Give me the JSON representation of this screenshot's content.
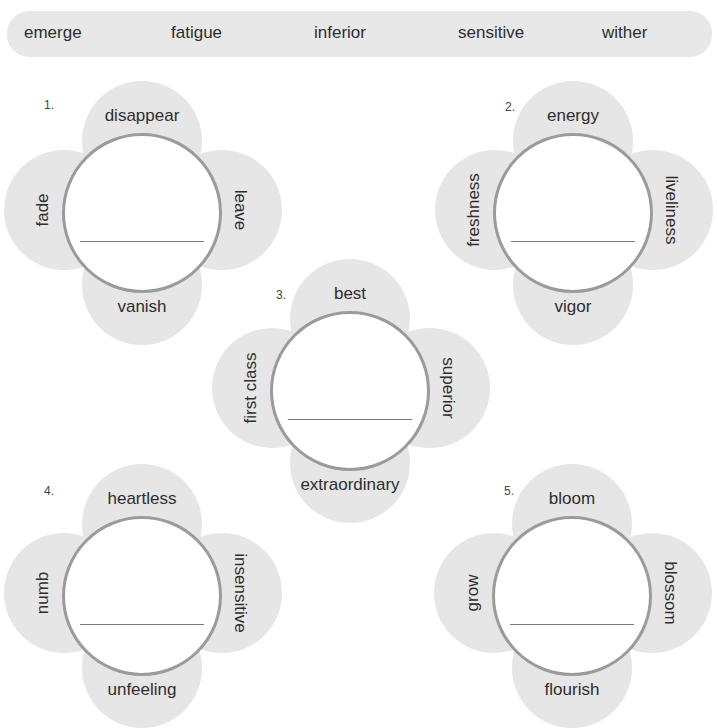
{
  "word_bank": {
    "words": [
      "emerge",
      "fatigue",
      "inferior",
      "sensitive",
      "wither"
    ]
  },
  "flowers": [
    {
      "number": "1.",
      "top": "disappear",
      "left": "fade",
      "right": "leave",
      "bottom": "vanish",
      "answer": ""
    },
    {
      "number": "2.",
      "top": "energy",
      "left": "freshness",
      "right": "liveliness",
      "bottom": "vigor",
      "answer": ""
    },
    {
      "number": "3.",
      "top": "best",
      "left": "first class",
      "right": "superior",
      "bottom": "extraordinary",
      "answer": ""
    },
    {
      "number": "4.",
      "top": "heartless",
      "left": "numb",
      "right": "insensitive",
      "bottom": "unfeeling",
      "answer": ""
    },
    {
      "number": "5.",
      "top": "bloom",
      "left": "grow",
      "right": "blossom",
      "bottom": "flourish",
      "answer": ""
    }
  ],
  "colors": {
    "petal": "#e6e6e6",
    "word_bank_bg": "#e8e8e8",
    "circle_border": "#9b9b9b",
    "answer_line": "#7a7a7a",
    "text": "#2e2e2e"
  }
}
